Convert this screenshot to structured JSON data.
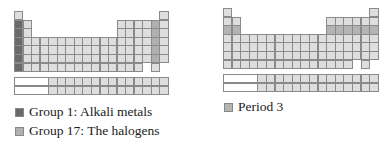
{
  "colors": {
    "cell_default": "#dedede",
    "group1": "#6a6a6a",
    "group17": "#b0b0b0",
    "period3": "#b4b4b4",
    "border": "#8a8a8a"
  },
  "left_table": {
    "title": "Periodic table highlighting Group 1 and Group 17",
    "highlights": [
      {
        "type": "group",
        "group": 1,
        "periods": [
          2,
          3,
          4,
          5,
          6,
          7
        ],
        "color_key": "group1"
      },
      {
        "type": "group",
        "group": 17,
        "periods": [
          2,
          3,
          4,
          5,
          6
        ],
        "color_key": "group17"
      }
    ]
  },
  "right_table": {
    "title": "Periodic table highlighting Period 3",
    "highlights": [
      {
        "type": "period",
        "period": 3,
        "color_key": "period3"
      }
    ]
  },
  "legend": {
    "left": [
      {
        "label": "Group 1: Alkali metals",
        "color_key": "group1"
      },
      {
        "label": "Group 17: The halogens",
        "color_key": "group17"
      }
    ],
    "right": [
      {
        "label": "Period 3",
        "color_key": "period3"
      }
    ]
  }
}
